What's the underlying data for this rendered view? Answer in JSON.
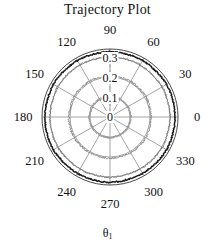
{
  "chart_data": {
    "type": "line",
    "coordinate_system": "polar",
    "title": "Trajectory Plot",
    "xlabel": "θ₁",
    "ylabel": "",
    "theta_unit": "degrees",
    "theta_ticks": [
      0,
      30,
      60,
      90,
      120,
      150,
      180,
      210,
      240,
      270,
      300,
      330
    ],
    "theta_tick_labels": [
      "0",
      "30",
      "60",
      "90",
      "120",
      "150",
      "180",
      "210",
      "240",
      "270",
      "300",
      "330"
    ],
    "r_ticks": [
      0,
      0.1,
      0.2,
      0.3
    ],
    "r_tick_labels": [
      "0",
      "0.1",
      "0.2",
      "0.3"
    ],
    "rlim": [
      0,
      0.34
    ],
    "grid": true,
    "legend": false,
    "series": [
      {
        "name": "outer-trajectory",
        "color": "#1c1c1c",
        "description": "near-circular dense trajectory at outer radius",
        "r_mean": 0.325,
        "theta": [
          0,
          15,
          30,
          45,
          60,
          75,
          90,
          105,
          120,
          135,
          150,
          165,
          180,
          195,
          210,
          225,
          240,
          255,
          270,
          285,
          300,
          315,
          330,
          345
        ],
        "r": [
          0.326,
          0.325,
          0.327,
          0.324,
          0.326,
          0.325,
          0.327,
          0.324,
          0.326,
          0.325,
          0.327,
          0.324,
          0.326,
          0.325,
          0.327,
          0.324,
          0.326,
          0.325,
          0.327,
          0.324,
          0.326,
          0.325,
          0.327,
          0.324
        ]
      },
      {
        "name": "mid-trajectory",
        "color": "#7a7a7a",
        "description": "near-circular trajectory just inside the outer ring",
        "r_mean": 0.3,
        "theta": [
          0,
          15,
          30,
          45,
          60,
          75,
          90,
          105,
          120,
          135,
          150,
          165,
          180,
          195,
          210,
          225,
          240,
          255,
          270,
          285,
          300,
          315,
          330,
          345
        ],
        "r": [
          0.301,
          0.299,
          0.302,
          0.298,
          0.301,
          0.3,
          0.302,
          0.299,
          0.301,
          0.3,
          0.302,
          0.298,
          0.301,
          0.3,
          0.302,
          0.299,
          0.301,
          0.3,
          0.302,
          0.298,
          0.301,
          0.3,
          0.302,
          0.299
        ]
      },
      {
        "name": "inner-trajectory",
        "color": "#8a8a8a",
        "description": "near-circular trajectory around r = 0.2",
        "r_mean": 0.205,
        "theta": [
          0,
          15,
          30,
          45,
          60,
          75,
          90,
          105,
          120,
          135,
          150,
          165,
          180,
          195,
          210,
          225,
          240,
          255,
          270,
          285,
          300,
          315,
          330,
          345
        ],
        "r": [
          0.206,
          0.204,
          0.207,
          0.203,
          0.206,
          0.205,
          0.207,
          0.204,
          0.206,
          0.205,
          0.207,
          0.203,
          0.206,
          0.205,
          0.207,
          0.204,
          0.206,
          0.205,
          0.207,
          0.203,
          0.206,
          0.205,
          0.207,
          0.204
        ]
      },
      {
        "name": "innermost-trajectory",
        "color": "#9a9a9a",
        "description": "near-circular trajectory around r = 0.1",
        "r_mean": 0.103,
        "theta": [
          0,
          15,
          30,
          45,
          60,
          75,
          90,
          105,
          120,
          135,
          150,
          165,
          180,
          195,
          210,
          225,
          240,
          255,
          270,
          285,
          300,
          315,
          330,
          345
        ],
        "r": [
          0.104,
          0.102,
          0.105,
          0.101,
          0.104,
          0.103,
          0.105,
          0.102,
          0.104,
          0.103,
          0.105,
          0.101,
          0.104,
          0.103,
          0.105,
          0.102,
          0.104,
          0.103,
          0.105,
          0.101,
          0.104,
          0.103,
          0.105,
          0.102
        ]
      }
    ]
  },
  "labels": {
    "title": "Trajectory Plot",
    "theta_axis": "θ",
    "theta_axis_sub": "1",
    "angles": [
      {
        "deg": 0,
        "text": "0"
      },
      {
        "deg": 30,
        "text": "30"
      },
      {
        "deg": 60,
        "text": "60"
      },
      {
        "deg": 90,
        "text": "90"
      },
      {
        "deg": 120,
        "text": "120"
      },
      {
        "deg": 150,
        "text": "150"
      },
      {
        "deg": 180,
        "text": "180"
      },
      {
        "deg": 210,
        "text": "210"
      },
      {
        "deg": 240,
        "text": "240"
      },
      {
        "deg": 270,
        "text": "270"
      },
      {
        "deg": 300,
        "text": "300"
      },
      {
        "deg": 330,
        "text": "330"
      }
    ],
    "radials": [
      {
        "value": 0,
        "text": "0"
      },
      {
        "value": 0.1,
        "text": "0.1"
      },
      {
        "value": 0.2,
        "text": "0.2"
      },
      {
        "value": 0.3,
        "text": "0.3"
      }
    ]
  },
  "colors": {
    "background": "#ffffff",
    "text": "#111111",
    "grid": "#9a9a9a",
    "outer_curve": "#1c1c1c",
    "mid_curve": "#6f6f6f"
  }
}
